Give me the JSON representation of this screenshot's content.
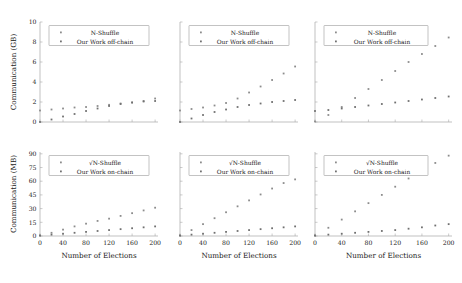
{
  "figure": {
    "xlabel": "Number of Elections",
    "ylabel_top": "Communication (GB)",
    "ylabel_bottom": "Communication (MB)"
  },
  "legend": {
    "top_series1": "N-Shuffle",
    "top_series2": "Our Work off-chain",
    "bottom_series1": "√N-Shuffle",
    "bottom_series2": "Our Work on-chain"
  },
  "colors": {
    "series1": "#8c8c8c",
    "series2": "#707070",
    "axis": "#a8a8a8",
    "text": "#1a1a1a"
  },
  "axes": {
    "x_ticks": [
      0,
      40,
      80,
      120,
      160,
      200
    ],
    "x_range": [
      0,
      205
    ],
    "y_ticks_top": [
      0,
      2,
      4,
      6,
      8,
      10
    ],
    "y_range_top": [
      0,
      10
    ],
    "y_ticks_bottom": [
      0,
      15,
      30,
      45,
      60,
      75,
      90
    ],
    "y_range_bottom": [
      0,
      92
    ]
  },
  "chart_data": [
    {
      "type": "scatter",
      "panel": "top-left",
      "title": "",
      "xlabel": "Number of Elections",
      "ylabel": "Communication (GB)",
      "xlim": [
        0,
        205
      ],
      "ylim": [
        0,
        10
      ],
      "x": [
        0,
        20,
        40,
        60,
        80,
        100,
        120,
        140,
        160,
        180,
        200
      ],
      "series": [
        {
          "name": "N-Shuffle",
          "values": [
            1.15,
            1.25,
            1.35,
            1.45,
            1.5,
            1.6,
            1.72,
            1.85,
            1.95,
            2.1,
            2.35
          ]
        },
        {
          "name": "Our Work off-chain",
          "values": [
            0.0,
            0.25,
            0.55,
            0.8,
            1.1,
            1.35,
            1.6,
            1.8,
            1.95,
            2.05,
            2.1
          ]
        }
      ]
    },
    {
      "type": "scatter",
      "panel": "top-middle",
      "title": "",
      "xlabel": "Number of Elections",
      "ylabel": "Communication (GB)",
      "xlim": [
        0,
        205
      ],
      "ylim": [
        0,
        10
      ],
      "x": [
        0,
        20,
        40,
        60,
        80,
        100,
        120,
        140,
        160,
        180,
        200
      ],
      "series": [
        {
          "name": "N-Shuffle",
          "values": [
            1.15,
            1.3,
            1.45,
            1.65,
            1.9,
            2.35,
            2.95,
            3.55,
            4.2,
            4.85,
            5.55
          ]
        },
        {
          "name": "Our Work off-chain",
          "values": [
            0.0,
            0.35,
            0.7,
            1.0,
            1.25,
            1.5,
            1.7,
            1.85,
            2.0,
            2.1,
            2.2
          ]
        }
      ]
    },
    {
      "type": "scatter",
      "panel": "top-right",
      "title": "",
      "xlabel": "Number of Elections",
      "ylabel": "Communication (GB)",
      "xlim": [
        0,
        205
      ],
      "ylim": [
        0,
        10
      ],
      "x": [
        0,
        20,
        40,
        60,
        80,
        100,
        120,
        140,
        160,
        180,
        200
      ],
      "series": [
        {
          "name": "N-Shuffle",
          "values": [
            0.05,
            0.7,
            1.5,
            2.4,
            3.3,
            4.2,
            5.1,
            6.0,
            6.8,
            7.6,
            8.45
          ]
        },
        {
          "name": "Our Work off-chain",
          "values": [
            1.1,
            1.2,
            1.35,
            1.5,
            1.65,
            1.8,
            1.95,
            2.1,
            2.25,
            2.4,
            2.55
          ]
        }
      ]
    },
    {
      "type": "scatter",
      "panel": "bottom-left",
      "title": "",
      "xlabel": "Number of Elections",
      "ylabel": "Communication (MB)",
      "xlim": [
        0,
        205
      ],
      "ylim": [
        0,
        92
      ],
      "x": [
        0,
        20,
        40,
        60,
        80,
        100,
        120,
        140,
        160,
        180,
        200
      ],
      "series": [
        {
          "name": "√N-Shuffle",
          "values": [
            0.5,
            3.5,
            7.0,
            10.5,
            13.5,
            16.5,
            19.0,
            22.0,
            25.0,
            28.0,
            31.0
          ]
        },
        {
          "name": "Our Work on-chain",
          "values": [
            0.5,
            1.5,
            2.5,
            3.5,
            4.5,
            5.5,
            6.5,
            7.5,
            8.5,
            9.5,
            10.5
          ]
        }
      ]
    },
    {
      "type": "scatter",
      "panel": "bottom-middle",
      "title": "",
      "xlabel": "Number of Elections",
      "ylabel": "Communication (MB)",
      "xlim": [
        0,
        205
      ],
      "ylim": [
        0,
        92
      ],
      "x": [
        0,
        20,
        40,
        60,
        80,
        100,
        120,
        140,
        160,
        180,
        200
      ],
      "series": [
        {
          "name": "√N-Shuffle",
          "values": [
            0.5,
            6.5,
            13.0,
            19.5,
            26.0,
            32.5,
            39.0,
            45.5,
            52.0,
            58.0,
            62.0
          ]
        },
        {
          "name": "Our Work on-chain",
          "values": [
            0.5,
            1.5,
            2.5,
            3.5,
            4.5,
            5.5,
            6.5,
            7.5,
            8.5,
            9.5,
            10.5
          ]
        }
      ]
    },
    {
      "type": "scatter",
      "panel": "bottom-right",
      "title": "",
      "xlabel": "Number of Elections",
      "ylabel": "Communication (MB)",
      "xlim": [
        0,
        205
      ],
      "ylim": [
        0,
        92
      ],
      "x": [
        0,
        20,
        40,
        60,
        80,
        100,
        120,
        140,
        160,
        180,
        200
      ],
      "series": [
        {
          "name": "√N-Shuffle",
          "values": [
            0.5,
            9.0,
            18.0,
            27.0,
            36.0,
            45.0,
            54.0,
            63.0,
            71.5,
            80.0,
            88.0
          ]
        },
        {
          "name": "Our Work on-chain",
          "values": [
            0.5,
            1.5,
            2.5,
            3.5,
            4.5,
            5.5,
            6.5,
            8.0,
            9.5,
            11.5,
            13.0
          ]
        }
      ]
    }
  ]
}
